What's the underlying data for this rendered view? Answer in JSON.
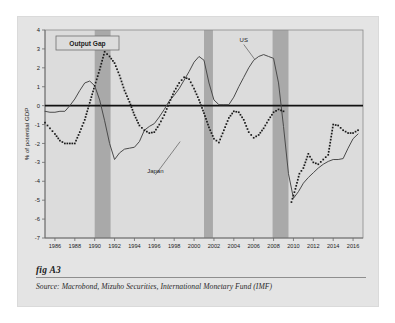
{
  "figure": {
    "fig_label": "fig A3",
    "source_prefix": "Source:",
    "source_text": "Macrobond, Mizuho Securities, International Monetary Fund (IMF)",
    "source_full": "Source:  Macrobond, Mizuho Securities, International Monetary Fund (IMF)"
  },
  "colors": {
    "page_background": "#ffffff",
    "card_background": "#e4e4e4",
    "plot_background": "#dcdcdc",
    "recession_band": "#a9a9a9",
    "us_line": "#4a4a4a",
    "japan_dots": "#1a1a1a",
    "zero_line": "#111111",
    "axis": "#6b6b6b",
    "text": "#1c1c1c"
  },
  "chart_data": {
    "type": "line",
    "title": "Output Gap",
    "xlabel": "",
    "ylabel": "% of potential GDP",
    "xlim": [
      1985,
      2017
    ],
    "ylim": [
      -7,
      4
    ],
    "yticks": [
      4,
      3,
      2,
      1,
      0,
      -1,
      -2,
      -3,
      -4,
      -5,
      -6,
      -7
    ],
    "ytick_labels": [
      "4",
      "3",
      "2",
      "1",
      "0",
      "-1",
      "-2",
      "-3",
      "-4",
      "-5",
      "-6",
      "-7"
    ],
    "xticks": [
      1986,
      1988,
      1990,
      1992,
      1994,
      1996,
      1998,
      2000,
      2002,
      2004,
      2006,
      2008,
      2010,
      2012,
      2014,
      2016
    ],
    "xtick_labels": [
      "1986",
      "1988",
      "1990",
      "1992",
      "1994",
      "1996",
      "1998",
      "2000",
      "2002",
      "2004",
      "2006",
      "2008",
      "2010",
      "2012",
      "2014",
      "2016"
    ],
    "grid": false,
    "legend_position": "inline-annotations",
    "zero_reference_line": 0,
    "annotations": [
      {
        "label": "US",
        "x": 2005.0,
        "y": 3.35,
        "target_x": 2006.1,
        "target_y": 2.45
      },
      {
        "label": "Japan",
        "x": 1996.1,
        "y": -3.55,
        "target_x": 1998.6,
        "target_y": -1.9
      }
    ],
    "shaded_bands": [
      {
        "name": "recession-1990-91",
        "x0": 1990.0,
        "x1": 1991.6,
        "label": "Recession"
      },
      {
        "name": "recession-2001",
        "x0": 2001.0,
        "x1": 2001.9,
        "label": "Recession"
      },
      {
        "name": "recession-2008-09",
        "x0": 2007.9,
        "x1": 2009.5,
        "label": "Recession"
      }
    ],
    "x": [
      1985,
      1985.5,
      1986,
      1986.5,
      1987,
      1987.5,
      1988,
      1988.5,
      1989,
      1989.5,
      1990,
      1990.5,
      1991,
      1991.5,
      1992,
      1992.5,
      1993,
      1993.5,
      1994,
      1994.5,
      1995,
      1995.5,
      1996,
      1996.5,
      1997,
      1997.5,
      1998,
      1998.5,
      1999,
      1999.5,
      2000,
      2000.5,
      2001,
      2001.5,
      2002,
      2002.5,
      2003,
      2003.5,
      2004,
      2004.5,
      2005,
      2005.5,
      2006,
      2006.5,
      2007,
      2007.5,
      2008,
      2008.5,
      2009,
      2009.5,
      2010,
      2010.5,
      2011,
      2011.5,
      2012,
      2012.5,
      2013,
      2013.5,
      2014,
      2014.5,
      2015,
      2015.5,
      2016,
      2016.5
    ],
    "series": [
      {
        "name": "US",
        "style": "solid",
        "color": "#4a4a4a",
        "values": [
          -0.3,
          -0.35,
          -0.35,
          -0.3,
          -0.3,
          0.0,
          0.35,
          0.8,
          1.2,
          1.3,
          1.05,
          0.3,
          -0.8,
          -2.0,
          -2.85,
          -2.5,
          -2.3,
          -2.25,
          -2.2,
          -1.9,
          -1.3,
          -1.1,
          -0.95,
          -0.6,
          -0.2,
          0.25,
          0.55,
          0.9,
          1.35,
          1.8,
          2.3,
          2.6,
          2.4,
          1.2,
          0.3,
          0.05,
          0.05,
          0.05,
          0.45,
          1.0,
          1.5,
          2.0,
          2.4,
          2.6,
          2.7,
          2.6,
          2.5,
          1.2,
          -1.1,
          -3.6,
          -4.9,
          -4.55,
          -4.1,
          -3.8,
          -3.55,
          -3.3,
          -3.1,
          -2.95,
          -2.85,
          -2.85,
          -2.8,
          -2.25,
          -1.75,
          -1.5
        ]
      },
      {
        "name": "Japan",
        "style": "dotted",
        "color": "#1a1a1a",
        "values": [
          -0.9,
          -1.2,
          -1.5,
          -1.85,
          -2.0,
          -2.0,
          -2.0,
          -1.4,
          -0.75,
          0.15,
          1.05,
          1.9,
          2.85,
          2.6,
          2.25,
          1.6,
          0.8,
          0.2,
          -0.5,
          -1.05,
          -1.3,
          -1.45,
          -1.4,
          -1.0,
          -0.5,
          0.15,
          0.75,
          1.2,
          1.5,
          1.4,
          0.9,
          0.3,
          -0.4,
          -1.15,
          -1.75,
          -1.95,
          -1.3,
          -0.65,
          -0.3,
          -0.35,
          -0.75,
          -1.4,
          -1.7,
          -1.55,
          -1.2,
          -0.75,
          -0.35,
          -0.2,
          -0.3,
          -0.6,
          -1.0,
          0.3,
          0.95,
          0.6,
          -0.3,
          -1.5,
          -2.6,
          -3.6,
          -4.35,
          -4.9,
          -5.3,
          -5.6,
          -5.8,
          -5.2
        ]
      }
    ],
    "series_extra_note": "Japan series continues to 2016; US and Japan both recover toward -1.5 by 2016"
  },
  "japan_points": {
    "x": [
      1985,
      1985.5,
      1986,
      1986.5,
      1987,
      1987.5,
      1988,
      1988.5,
      1989,
      1989.5,
      1990,
      1990.5,
      1991,
      1991.5,
      1992,
      1992.5,
      1993,
      1993.5,
      1994,
      1994.5,
      1995,
      1995.5,
      1996,
      1996.5,
      1997,
      1997.5,
      1998,
      1998.5,
      1999,
      1999.5,
      2000,
      2000.5,
      2001,
      2001.5,
      2002,
      2002.5,
      2003,
      2003.5,
      2004,
      2004.5,
      2005,
      2005.5,
      2006,
      2006.5,
      2007,
      2007.5,
      2008,
      2008.5,
      2009,
      2009.5,
      2010,
      2010.5,
      2011,
      2011.5,
      2012,
      2012.5,
      2013,
      2013.5,
      2014,
      2014.5,
      2015,
      2015.5,
      2016,
      2016.5
    ],
    "y": [
      -0.9,
      -1.2,
      -1.5,
      -1.85,
      -2.0,
      -2.0,
      -2.0,
      -1.4,
      -0.75,
      0.15,
      1.05,
      1.9,
      2.85,
      2.6,
      2.25,
      1.6,
      0.8,
      0.2,
      -0.5,
      -1.05,
      -1.3,
      -1.45,
      -1.4,
      -1.0,
      -0.5,
      0.15,
      0.75,
      1.2,
      1.5,
      1.4,
      0.9,
      0.3,
      -0.4,
      -1.15,
      -1.75,
      -1.95,
      -1.3,
      -0.65,
      -0.3,
      -0.35,
      -0.75,
      -1.4,
      -1.7,
      -1.55,
      -1.2,
      -0.75,
      -0.35,
      -0.2,
      -0.3,
      -0.6,
      -1.0,
      0.3,
      0.95,
      0.6,
      -0.3,
      -1.5,
      -2.6,
      -3.6,
      -4.35,
      -4.9,
      -5.3,
      -5.6,
      -5.8,
      -5.2
    ]
  },
  "japan_tail": {
    "x": [
      2009.8,
      2010.2,
      2010.6,
      2011.0,
      2011.5,
      2012.0,
      2012.5,
      2013.0,
      2013.5,
      2014.0,
      2014.5,
      2015.0,
      2015.5,
      2016.0,
      2016.5
    ],
    "y": [
      -5.1,
      -4.4,
      -3.6,
      -3.3,
      -2.55,
      -3.0,
      -3.1,
      -2.85,
      -2.6,
      -1.0,
      -1.05,
      -1.3,
      -1.45,
      -1.45,
      -1.3
    ]
  }
}
